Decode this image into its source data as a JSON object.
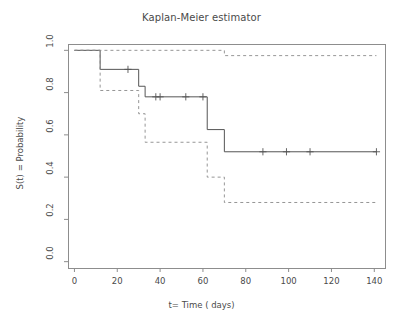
{
  "chart_data": {
    "type": "line",
    "title": "Kaplan-Meier estimator",
    "xlabel": "t= Time ( days)",
    "ylabel": "S(t) = Probability",
    "xlim": [
      -3,
      145
    ],
    "ylim": [
      -0.03,
      1.03
    ],
    "xticks": [
      0,
      20,
      40,
      60,
      80,
      100,
      120,
      140
    ],
    "yticks": [
      0.0,
      0.2,
      0.4,
      0.6,
      0.8,
      1.0
    ],
    "ytick_labels": [
      "0.0",
      "0.2",
      "0.4",
      "0.6",
      "0.8",
      "1.0"
    ],
    "xtick_labels": [
      "0",
      "20",
      "40",
      "60",
      "80",
      "100",
      "120",
      "140"
    ],
    "grid": false,
    "legend": "none",
    "series": [
      {
        "name": "Survival estimate",
        "style": "solid",
        "color": "#555555",
        "step": "post",
        "x": [
          0,
          12,
          12,
          30,
          30,
          33,
          33,
          62,
          62,
          70,
          70,
          141
        ],
        "y": [
          1.0,
          1.0,
          0.91,
          0.91,
          0.83,
          0.83,
          0.78,
          0.78,
          0.625,
          0.625,
          0.52,
          0.52
        ],
        "points": [
          {
            "t": 0,
            "s": 1.0
          },
          {
            "t": 12,
            "s": 0.91
          },
          {
            "t": 30,
            "s": 0.83
          },
          {
            "t": 33,
            "s": 0.78
          },
          {
            "t": 62,
            "s": 0.625
          },
          {
            "t": 70,
            "s": 0.52
          },
          {
            "t": 141,
            "s": 0.52
          }
        ],
        "censored": [
          {
            "t": 25,
            "s": 0.91
          },
          {
            "t": 38,
            "s": 0.78
          },
          {
            "t": 40,
            "s": 0.78
          },
          {
            "t": 52,
            "s": 0.78
          },
          {
            "t": 60,
            "s": 0.78
          },
          {
            "t": 88,
            "s": 0.52
          },
          {
            "t": 99,
            "s": 0.52
          },
          {
            "t": 110,
            "s": 0.52
          },
          {
            "t": 141,
            "s": 0.52
          }
        ]
      },
      {
        "name": "Upper 95% confidence band",
        "style": "dashed",
        "color": "#8a8a8a",
        "step": "post",
        "x": [
          0,
          70,
          70,
          141
        ],
        "y": [
          1.0,
          1.0,
          0.975,
          0.975
        ]
      },
      {
        "name": "Lower 95% confidence band",
        "style": "dashed",
        "color": "#8a8a8a",
        "step": "post",
        "x": [
          0,
          12,
          12,
          30,
          30,
          33,
          33,
          62,
          62,
          70,
          70,
          141
        ],
        "y": [
          1.0,
          1.0,
          0.81,
          0.81,
          0.7,
          0.7,
          0.565,
          0.565,
          0.4,
          0.4,
          0.28,
          0.28
        ]
      }
    ]
  },
  "axes": {
    "title": "Kaplan-Meier estimator",
    "xlabel": "t= Time ( days)",
    "ylabel": "S(t) = Probability",
    "xtick_labels": [
      "0",
      "20",
      "40",
      "60",
      "80",
      "100",
      "120",
      "140"
    ],
    "ytick_labels": [
      "0.0",
      "0.2",
      "0.4",
      "0.6",
      "0.8",
      "1.0"
    ]
  },
  "colors": {
    "curve": "#555555",
    "band": "#8a8a8a",
    "frame": "#8d8d8d",
    "text": "#4a4a4a",
    "background": "#ffffff"
  }
}
